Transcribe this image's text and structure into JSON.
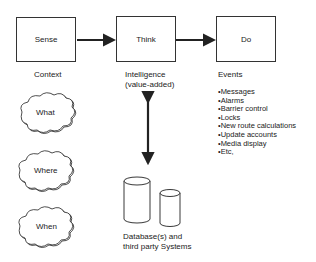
{
  "nodes": {
    "sense": {
      "label": "Sense",
      "caption": "Context"
    },
    "think": {
      "label": "Think",
      "caption_line1": "Intelligence",
      "caption_line2": "(value-added)"
    },
    "do": {
      "label": "Do",
      "caption": "Events"
    }
  },
  "events": [
    "•Messages",
    "•Alarms",
    "•Barrier control",
    "•Locks",
    "•New route calculations",
    "•Update accounts",
    "•Media display",
    "•Etc,"
  ],
  "clouds": [
    "What",
    "Where",
    "When"
  ],
  "database": {
    "line1": "Database(s) and",
    "line2": "third party Systems"
  },
  "colors": {
    "stroke": "#222222",
    "background": "#ffffff"
  }
}
